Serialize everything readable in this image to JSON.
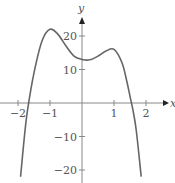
{
  "chart_data": {
    "type": "line",
    "title": "",
    "xlabel": "x",
    "ylabel": "y",
    "xlim": [
      -2.5,
      2.7
    ],
    "ylim": [
      -24,
      26
    ],
    "x_ticks": [
      -2,
      -1,
      1,
      2
    ],
    "x_tick_labels": [
      "−2",
      "−1",
      "1",
      "2"
    ],
    "y_ticks": [
      20,
      10,
      -10,
      -20
    ],
    "y_tick_labels": [
      "20",
      "10",
      "−10",
      "−20"
    ],
    "grid": false,
    "series": [
      {
        "name": "f(x)",
        "color": "#666666",
        "x": [
          -1.92,
          -1.8,
          -1.7,
          -1.5,
          -1.25,
          -1.0,
          -0.75,
          -0.5,
          -0.25,
          0.0,
          0.25,
          0.5,
          0.75,
          1.0,
          1.25,
          1.4,
          1.5,
          1.6,
          1.7,
          1.85
        ],
        "y": [
          -22,
          -10,
          -2,
          9,
          18.5,
          22,
          20.5,
          17,
          14,
          13,
          12.9,
          14,
          15.5,
          16,
          12,
          6.5,
          2,
          -2.5,
          -8.5,
          -22
        ]
      }
    ]
  }
}
